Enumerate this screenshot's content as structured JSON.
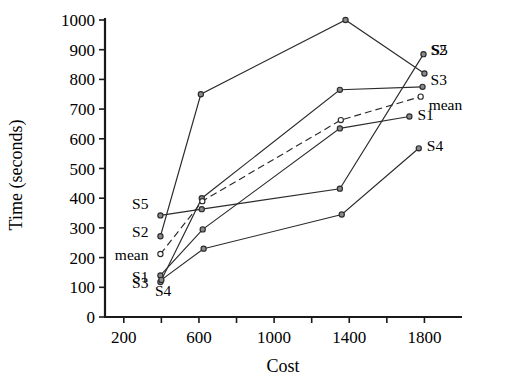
{
  "chart_data": {
    "type": "line",
    "title": "",
    "xlabel": "Cost",
    "ylabel": "Time (seconds)",
    "xlim": [
      100,
      2000
    ],
    "ylim": [
      0,
      1000
    ],
    "xticks": [
      200,
      600,
      1000,
      1400,
      1800
    ],
    "xticks_minor": [
      200,
      400,
      600,
      800,
      1000,
      1200,
      1400,
      1600,
      1800
    ],
    "yticks": [
      0,
      100,
      200,
      300,
      400,
      500,
      600,
      700,
      800,
      900,
      1000
    ],
    "grid": false,
    "legend": "inline-endpoint-labels",
    "series": [
      {
        "name": "S1",
        "style": "solid",
        "marker": "open-circle",
        "x": [
          395,
          620,
          1350,
          1720
        ],
        "y": [
          140,
          295,
          635,
          675
        ],
        "label_left": "S1",
        "label_right": "S1"
      },
      {
        "name": "S2",
        "style": "solid",
        "marker": "open-circle",
        "x": [
          395,
          610,
          1380,
          1800
        ],
        "y": [
          272,
          750,
          1000,
          820
        ],
        "label_left": "S2",
        "label_right": "S2"
      },
      {
        "name": "S3",
        "style": "solid",
        "marker": "open-circle",
        "x": [
          395,
          615,
          1350,
          1790
        ],
        "y": [
          118,
          400,
          765,
          775
        ],
        "label_left": "S3",
        "label_right": "S3"
      },
      {
        "name": "S4",
        "style": "solid",
        "marker": "open-circle",
        "x": [
          400,
          625,
          1360,
          1770
        ],
        "y": [
          125,
          230,
          345,
          568
        ],
        "label_left": "S4",
        "label_right": "S4"
      },
      {
        "name": "S5",
        "style": "solid",
        "marker": "open-circle",
        "x": [
          395,
          615,
          1350,
          1795
        ],
        "y": [
          342,
          363,
          432,
          885
        ],
        "label_left": "S5",
        "label_right": "S5"
      },
      {
        "name": "mean",
        "style": "dashed",
        "marker": "open-circle",
        "x": [
          395,
          618,
          1355,
          1780
        ],
        "y": [
          212,
          390,
          663,
          742
        ],
        "label_left": "mean",
        "label_right": "mean"
      }
    ],
    "left_labels": [
      "S5",
      "S2",
      "mean",
      "S1",
      "S3",
      "S4"
    ],
    "right_labels": [
      "S2",
      "S5",
      "S3",
      "mean",
      "S1",
      "S4"
    ]
  },
  "axes": {
    "x_title": "Cost",
    "y_title": "Time (seconds)",
    "y_tick_labels": [
      "1000",
      "900",
      "800",
      "700",
      "600",
      "500",
      "400",
      "300",
      "200",
      "100",
      "0"
    ],
    "x_tick_labels": [
      "200",
      "600",
      "1000",
      "1400",
      "1800"
    ]
  },
  "colors": {
    "line": "#2b2b2b",
    "axis": "#1a1a1a",
    "background": "#ffffff",
    "marker_fill": "#ffffff"
  }
}
